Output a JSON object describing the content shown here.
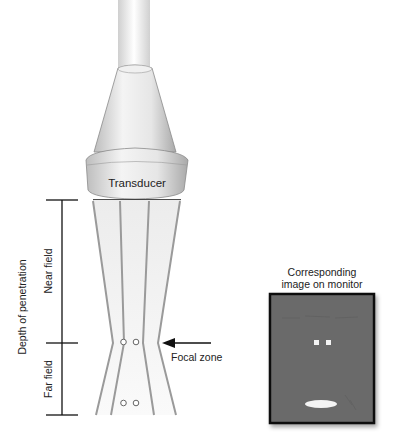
{
  "diagram": {
    "transducer_label": "Transducer",
    "depth_label": "Depth of penetration",
    "near_field_label": "Near field",
    "far_field_label": "Far field",
    "focal_zone_label": "Focal zone",
    "monitor_caption_line1": "Corresponding",
    "monitor_caption_line2": "image on monitor"
  },
  "colors": {
    "beam_line": "#9a9a9a",
    "beam_fill": "#f2f2f2",
    "monitor_bg": "#6b6b6b",
    "monitor_border": "#111111",
    "text": "#222222"
  }
}
